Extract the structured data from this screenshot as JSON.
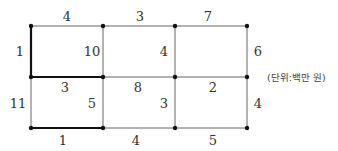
{
  "diagram": {
    "unit_label": "(단위:백만 원)",
    "nodes_x": [
      31,
      103,
      175,
      247
    ],
    "nodes_y": [
      26,
      77,
      128
    ],
    "edges": [
      {
        "id": "top-1",
        "label": "4",
        "x1": 31,
        "y1": 26,
        "x2": 103,
        "y2": 26,
        "bold": false,
        "lx": 67,
        "ly": 16
      },
      {
        "id": "top-2",
        "label": "3",
        "x1": 103,
        "y1": 26,
        "x2": 175,
        "y2": 26,
        "bold": false,
        "lx": 140,
        "ly": 16
      },
      {
        "id": "top-3",
        "label": "7",
        "x1": 175,
        "y1": 26,
        "x2": 247,
        "y2": 26,
        "bold": false,
        "lx": 208,
        "ly": 16
      },
      {
        "id": "left-upper",
        "label": "1",
        "x1": 31,
        "y1": 26,
        "x2": 31,
        "y2": 77,
        "bold": true,
        "lx": 20,
        "ly": 51
      },
      {
        "id": "mid-upper-1",
        "label": "10",
        "x1": 103,
        "y1": 26,
        "x2": 103,
        "y2": 77,
        "bold": false,
        "lx": 92,
        "ly": 51
      },
      {
        "id": "mid-upper-2",
        "label": "4",
        "x1": 175,
        "y1": 26,
        "x2": 175,
        "y2": 77,
        "bold": false,
        "lx": 164,
        "ly": 51
      },
      {
        "id": "right-upper",
        "label": "6",
        "x1": 247,
        "y1": 26,
        "x2": 247,
        "y2": 77,
        "bold": false,
        "lx": 258,
        "ly": 51
      },
      {
        "id": "middle-1",
        "label": "3",
        "x1": 31,
        "y1": 77,
        "x2": 103,
        "y2": 77,
        "bold": true,
        "lx": 65,
        "ly": 87
      },
      {
        "id": "middle-2",
        "label": "8",
        "x1": 103,
        "y1": 77,
        "x2": 175,
        "y2": 77,
        "bold": false,
        "lx": 138,
        "ly": 87
      },
      {
        "id": "middle-3",
        "label": "2",
        "x1": 175,
        "y1": 77,
        "x2": 247,
        "y2": 77,
        "bold": false,
        "lx": 213,
        "ly": 87
      },
      {
        "id": "left-lower",
        "label": "11",
        "x1": 31,
        "y1": 77,
        "x2": 31,
        "y2": 128,
        "bold": false,
        "lx": 18,
        "ly": 103
      },
      {
        "id": "mid-lower-1",
        "label": "5",
        "x1": 103,
        "y1": 77,
        "x2": 103,
        "y2": 128,
        "bold": false,
        "lx": 92,
        "ly": 103
      },
      {
        "id": "mid-lower-2",
        "label": "3",
        "x1": 175,
        "y1": 77,
        "x2": 175,
        "y2": 128,
        "bold": false,
        "lx": 164,
        "ly": 103
      },
      {
        "id": "right-lower",
        "label": "4",
        "x1": 247,
        "y1": 77,
        "x2": 247,
        "y2": 128,
        "bold": false,
        "lx": 258,
        "ly": 103
      },
      {
        "id": "bottom-1",
        "label": "1",
        "x1": 31,
        "y1": 128,
        "x2": 103,
        "y2": 128,
        "bold": true,
        "lx": 63,
        "ly": 140
      },
      {
        "id": "bottom-2",
        "label": "4",
        "x1": 103,
        "y1": 128,
        "x2": 175,
        "y2": 128,
        "bold": false,
        "lx": 136,
        "ly": 140
      },
      {
        "id": "bottom-3",
        "label": "5",
        "x1": 175,
        "y1": 128,
        "x2": 247,
        "y2": 128,
        "bold": false,
        "lx": 213,
        "ly": 140
      }
    ]
  }
}
